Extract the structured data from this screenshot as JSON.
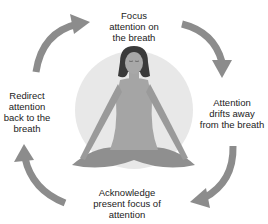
{
  "diagram": {
    "type": "cycle",
    "steps": [
      {
        "label": "Focus\nattention on\nthe breath",
        "lines": [
          "Focus",
          "attention on",
          "the breath"
        ]
      },
      {
        "label": "Attention drifts away from the breath",
        "lines": [
          "Attention",
          "drifts away",
          "from the breath"
        ]
      },
      {
        "label": "Acknowledge present focus of attention",
        "lines": [
          "Acknowledge",
          "present focus of",
          "attention"
        ]
      },
      {
        "label": "Redirect attention back to the breath",
        "lines": [
          "Redirect",
          "attention",
          "back to the",
          "breath"
        ]
      }
    ],
    "center_figure": "meditating-woman",
    "colors": {
      "arrow": "#8c8c8c",
      "halo": "#e6e6e6",
      "figure": "#9a9a9a",
      "hair": "#3a3a3a",
      "text": "#222222"
    }
  }
}
